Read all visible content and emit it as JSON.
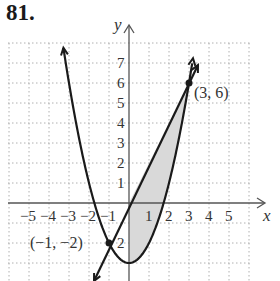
{
  "problem_number": "81.",
  "axes": {
    "x_label": "x",
    "y_label": "y"
  },
  "x_ticks": [
    "−5",
    "−4",
    "−3",
    "−2",
    "−1",
    "1",
    "2",
    "3",
    "4",
    "5"
  ],
  "y_ticks": [
    "1",
    "2",
    "3",
    "4",
    "5",
    "6",
    "7"
  ],
  "neg_y_tick": "2",
  "points": [
    {
      "label": "(3, 6)",
      "x": 3,
      "y": 6
    },
    {
      "label": "(−1, −2)",
      "x": -1,
      "y": -2
    }
  ],
  "colors": {
    "curve": "#1a1a1a",
    "shade": "#d9d9d9",
    "grid": "#b0b0b0",
    "axis": "#555555"
  },
  "chart_data": {
    "type": "line",
    "title": "81.",
    "xlabel": "x",
    "ylabel": "y",
    "xlim": [
      -6,
      6
    ],
    "ylim": [
      -4,
      8
    ],
    "grid": true,
    "series": [
      {
        "name": "parabola y = x^2 - 3",
        "x": [
          -3.3,
          -3,
          -2,
          -1,
          0,
          1,
          2,
          3,
          3.2
        ],
        "y": [
          7.9,
          6,
          1,
          -2,
          -3,
          -2,
          1,
          6,
          7.2
        ]
      },
      {
        "name": "line y = 2x",
        "x": [
          -1.7,
          -1,
          0,
          1,
          2,
          3,
          3.6
        ],
        "y": [
          -3.4,
          -2,
          0,
          2,
          4,
          6,
          7.2
        ]
      }
    ],
    "annotations": [
      {
        "text": "(3, 6)",
        "x": 3,
        "y": 6
      },
      {
        "text": "(−1, −2)",
        "x": -1,
        "y": -2
      }
    ],
    "shaded_region": "between y = 2x (above) and y = x^2 - 3 (below), for 0 ≤ x ≤ 3"
  }
}
